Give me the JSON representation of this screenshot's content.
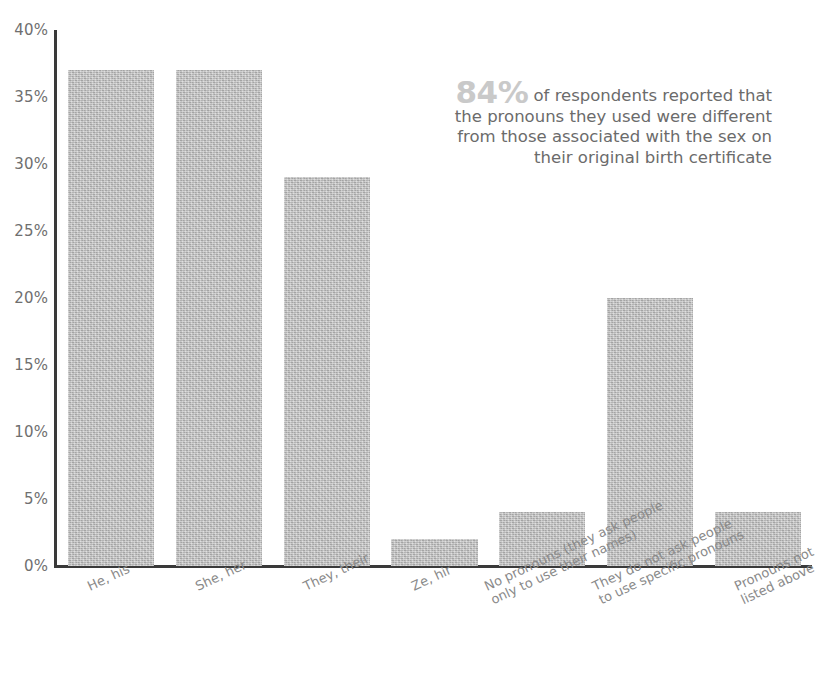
{
  "chart_data": {
    "type": "bar",
    "title": "",
    "subtitle": "",
    "xlabel": "",
    "ylabel": "",
    "ylim": [
      0,
      40
    ],
    "grid": false,
    "legend": "none",
    "orientation": "vertical",
    "value_suffix": "%",
    "categories": [
      "He, his",
      "She, her",
      "They, their",
      "Ze, hir",
      "No pronouns (they ask people\nonly to use their names)",
      "They do not ask people\nto use specific pronouns",
      "Pronouns not listed above"
    ],
    "values": [
      37,
      37,
      29,
      2,
      4,
      20,
      4
    ],
    "ytick_labels": [
      "0%",
      "5%",
      "10%",
      "15%",
      "20%",
      "25%",
      "30%",
      "35%",
      "40%"
    ],
    "ytick_values": [
      0,
      5,
      10,
      15,
      20,
      25,
      30,
      35,
      40
    ],
    "bar_color": "#bdbdbd",
    "axis_color": "#3a3a3a",
    "tick_label_color": "#6f6f6f",
    "category_label_color": "#8a8a8a",
    "annotation": {
      "stat": "84%",
      "body": " of respondents reported that the pronouns they used were different from those associated with the sex on their original birth certificate",
      "stat_color": "#c9c9c9",
      "body_color": "#6b6b6b"
    }
  }
}
